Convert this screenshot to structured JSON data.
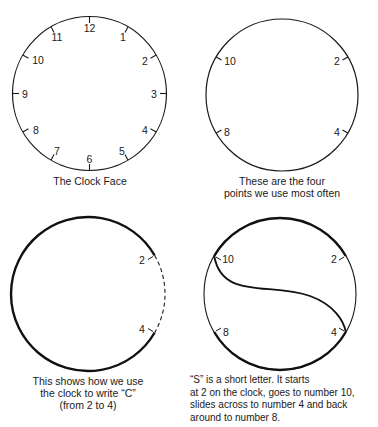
{
  "panels": [
    {
      "id": "clock-face",
      "caption_lines": [
        "The Clock Face"
      ],
      "numbers": [
        "12",
        "1",
        "2",
        "3",
        "4",
        "5",
        "6",
        "7",
        "8",
        "9",
        "10",
        "11"
      ]
    },
    {
      "id": "four-points",
      "caption_lines": [
        "These are the four",
        "points we use most often"
      ],
      "numbers": [
        "2",
        "4",
        "8",
        "10"
      ]
    },
    {
      "id": "letter-c",
      "caption_lines": [
        "This shows how we use",
        "the clock to write “C”",
        "(from 2 to 4)"
      ],
      "numbers": [
        "2",
        "4"
      ]
    },
    {
      "id": "letter-s",
      "caption_lines": [
        "“S” is a short letter.  It starts",
        "at 2 on the clock, goes to number 10,",
        "slides across to number 4 and back",
        "around to number 8."
      ],
      "numbers": [
        "2",
        "4",
        "8",
        "10"
      ]
    }
  ],
  "colors": {
    "ink": "#1a1a1a",
    "background": "#ffffff"
  }
}
